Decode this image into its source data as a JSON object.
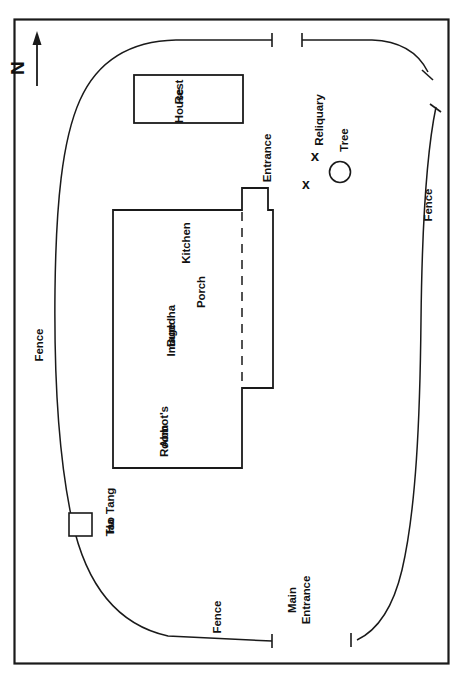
{
  "figure": {
    "kind": "site-plan",
    "orientation_note": "plan rotated 90 degrees; labels read bottom-to-top",
    "background_color": "#ffffff",
    "ink_color": "#1a1a1a"
  },
  "compass": {
    "label": "N",
    "icon": "north-arrow-icon",
    "direction": "up-in-rotated-frame"
  },
  "buildings": [
    {
      "id": "rest-house",
      "label_lines": [
        "Rest",
        "House"
      ],
      "shape": "rectangle"
    },
    {
      "id": "main-hall",
      "shape": "L-shaped-block",
      "rooms": [
        {
          "id": "kitchen",
          "label_lines": [
            "Kitchen"
          ]
        },
        {
          "id": "buddha-image",
          "label_lines": [
            "Buddha",
            "Image"
          ]
        },
        {
          "id": "abbots-room",
          "label_lines": [
            "Abbot's",
            "Room"
          ]
        },
        {
          "id": "porch",
          "label_lines": [
            "Porch"
          ]
        }
      ],
      "entrance": {
        "id": "entrance",
        "label_lines": [
          "Entrance"
        ]
      }
    },
    {
      "id": "tao-tang-ha",
      "label_lines": [
        "Tao Tang",
        "Ha"
      ],
      "shape": "small-square"
    }
  ],
  "features": [
    {
      "id": "reliquary",
      "label_lines": [
        "Reliquary"
      ],
      "marker": "x-mark",
      "marker_count": 2,
      "marker_glyphs": [
        "x",
        "x"
      ]
    },
    {
      "id": "tree",
      "label_lines": [
        "Tree"
      ],
      "marker": "circle-mark"
    }
  ],
  "boundary": {
    "fence_labels": [
      "Fence",
      "Fence",
      "Fence"
    ],
    "gates": [
      {
        "id": "main-entrance",
        "label_lines": [
          "Main",
          "Entrance"
        ]
      },
      {
        "id": "north-gap",
        "label_lines": []
      }
    ]
  },
  "labels": {
    "north": "N",
    "rest_line1": "Rest",
    "rest_line2": "House",
    "kitchen": "Kitchen",
    "buddha_line1": "Buddha",
    "buddha_line2": "Image",
    "abbot_line1": "Abbot's",
    "abbot_line2": "Room",
    "porch": "Porch",
    "entrance": "Entrance",
    "reliquary": "Reliquary",
    "tree": "Tree",
    "tao_line1": "Tao Tang",
    "tao_line2": "Ha",
    "fence_left": "Fence",
    "fence_right": "Fence",
    "fence_bottom": "Fence",
    "main_entrance_line1": "Main",
    "main_entrance_line2": "Entrance",
    "x_mark_1": "x",
    "x_mark_2": "x"
  }
}
